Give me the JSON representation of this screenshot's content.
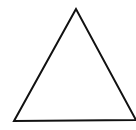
{
  "diagram": {
    "shape": "triangle",
    "points": "76,9 14,121 136,120",
    "stroke": "#111111",
    "fill": "#ffffff",
    "stroke_width": "2"
  }
}
